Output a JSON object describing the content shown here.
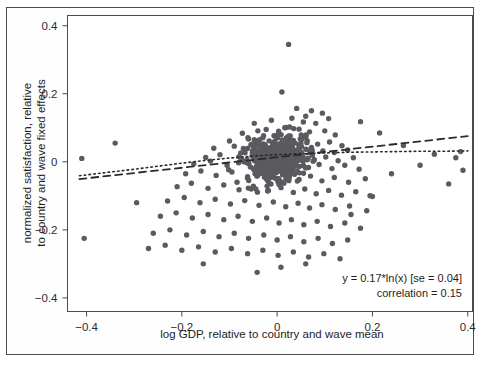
{
  "figure": {
    "background_color": "#ffffff",
    "frame_color": "#4a4a4f",
    "point_color": "#5a5a5f",
    "line_color": "#2b2b2b"
  },
  "axes": {
    "x_label": "log GDP, relative to country and wave mean",
    "y_label_line1": "normalized satisfaction, relative",
    "y_label_line2": "to country and wave fixed effects",
    "x_ticks": [
      "−0.4",
      "−0.2",
      "0",
      "0.2",
      "0.4"
    ],
    "y_ticks": [
      "0.4",
      "0.2",
      "0",
      "−0.2",
      "−0.4"
    ]
  },
  "annotations": {
    "fit_equation": "y = 0.17*ln(x) [se = 0.04]",
    "correlation": "correlation = 0.15"
  },
  "chart_data": {
    "type": "scatter",
    "title": "",
    "xlabel": "log GDP, relative to country and wave mean",
    "ylabel": "normalized satisfaction, relative to country and wave fixed effects",
    "xlim": [
      -0.44,
      0.41
    ],
    "ylim": [
      -0.44,
      0.43
    ],
    "x_ticks": [
      -0.4,
      -0.2,
      0,
      0.2,
      0.4
    ],
    "y_ticks": [
      -0.4,
      -0.2,
      0,
      0.2,
      0.4
    ],
    "grid": false,
    "legend": null,
    "annotations": [
      {
        "text": "y = 0.17*ln(x) [se = 0.04]",
        "x": 0.39,
        "y": -0.3,
        "align": "right"
      },
      {
        "text": "correlation = 0.15",
        "x": 0.39,
        "y": -0.335,
        "align": "right"
      }
    ],
    "fits": [
      {
        "name": "log fit (dotted)",
        "style": "dotted",
        "form": "y = 0.17*ln(x) scaled; concave, flattening to the right",
        "points": [
          [
            -0.415,
            -0.041
          ],
          [
            -0.35,
            -0.03
          ],
          [
            -0.3,
            -0.022
          ],
          [
            -0.25,
            -0.013
          ],
          [
            -0.2,
            -0.004
          ],
          [
            -0.15,
            0.004
          ],
          [
            -0.1,
            0.011
          ],
          [
            -0.05,
            0.017
          ],
          [
            0.0,
            0.021
          ],
          [
            0.05,
            0.024
          ],
          [
            0.1,
            0.026
          ],
          [
            0.15,
            0.028
          ],
          [
            0.2,
            0.029
          ],
          [
            0.25,
            0.03
          ],
          [
            0.3,
            0.031
          ],
          [
            0.35,
            0.031
          ],
          [
            0.4,
            0.032
          ]
        ]
      },
      {
        "name": "linear fit (dashed)",
        "style": "dashed",
        "slope": 0.155,
        "intercept": 0.0135,
        "points": [
          [
            -0.415,
            -0.0508
          ],
          [
            0.4,
            0.0755
          ]
        ]
      }
    ],
    "n_points": 612,
    "correlation": 0.15,
    "points": [
      [
        0.024,
        0.345
      ],
      [
        0.01,
        0.205
      ],
      [
        0.041,
        0.157
      ],
      [
        0.072,
        0.15
      ],
      [
        0.095,
        0.143
      ],
      [
        -0.012,
        0.122
      ],
      [
        0.031,
        0.128
      ],
      [
        0.055,
        0.117
      ],
      [
        -0.048,
        0.113
      ],
      [
        0.06,
        0.134
      ],
      [
        0.081,
        0.113
      ],
      [
        0.108,
        0.127
      ],
      [
        0.016,
        0.1
      ],
      [
        -0.023,
        0.095
      ],
      [
        -0.073,
        0.084
      ],
      [
        0.003,
        0.09
      ],
      [
        0.046,
        0.096
      ],
      [
        0.068,
        0.088
      ],
      [
        0.1,
        0.091
      ],
      [
        0.122,
        0.079
      ],
      [
        -0.1,
        0.061
      ],
      [
        -0.06,
        0.067
      ],
      [
        -0.03,
        0.071
      ],
      [
        -0.005,
        0.06
      ],
      [
        0.02,
        0.069
      ],
      [
        0.038,
        0.055
      ],
      [
        0.063,
        0.062
      ],
      [
        0.085,
        0.052
      ],
      [
        0.11,
        0.058
      ],
      [
        0.136,
        0.047
      ],
      [
        -0.133,
        0.04
      ],
      [
        -0.09,
        0.046
      ],
      [
        -0.055,
        0.05
      ],
      [
        -0.025,
        0.036
      ],
      [
        0.002,
        0.045
      ],
      [
        0.026,
        0.038
      ],
      [
        0.048,
        0.03
      ],
      [
        0.072,
        0.042
      ],
      [
        0.096,
        0.032
      ],
      [
        0.12,
        0.027
      ],
      [
        0.148,
        0.035
      ],
      [
        -0.15,
        0.013
      ],
      [
        -0.12,
        0.021
      ],
      [
        -0.08,
        0.015
      ],
      [
        -0.045,
        0.024
      ],
      [
        -0.018,
        0.01
      ],
      [
        0.006,
        0.018
      ],
      [
        0.03,
        0.008
      ],
      [
        0.054,
        0.016
      ],
      [
        0.078,
        0.006
      ],
      [
        0.102,
        0.014
      ],
      [
        0.128,
        0.003
      ],
      [
        0.16,
        0.012
      ],
      [
        -0.175,
        -0.006
      ],
      [
        -0.14,
        0.002
      ],
      [
        -0.105,
        -0.01
      ],
      [
        -0.07,
        0.0
      ],
      [
        -0.04,
        -0.014
      ],
      [
        -0.01,
        -0.004
      ],
      [
        0.012,
        -0.016
      ],
      [
        0.036,
        -0.006
      ],
      [
        0.06,
        -0.018
      ],
      [
        0.088,
        -0.008
      ],
      [
        0.115,
        -0.02
      ],
      [
        0.142,
        -0.01
      ],
      [
        0.172,
        -0.022
      ],
      [
        -0.192,
        -0.035
      ],
      [
        -0.16,
        -0.027
      ],
      [
        -0.128,
        -0.04
      ],
      [
        -0.095,
        -0.03
      ],
      [
        -0.062,
        -0.044
      ],
      [
        -0.032,
        -0.034
      ],
      [
        -0.004,
        -0.048
      ],
      [
        0.022,
        -0.038
      ],
      [
        0.046,
        -0.052
      ],
      [
        0.07,
        -0.042
      ],
      [
        0.094,
        -0.056
      ],
      [
        0.12,
        -0.046
      ],
      [
        0.15,
        -0.06
      ],
      [
        0.185,
        -0.05
      ],
      [
        -0.21,
        -0.073
      ],
      [
        -0.18,
        -0.063
      ],
      [
        -0.145,
        -0.078
      ],
      [
        -0.112,
        -0.068
      ],
      [
        -0.08,
        -0.082
      ],
      [
        -0.05,
        -0.072
      ],
      [
        -0.02,
        -0.086
      ],
      [
        0.008,
        -0.076
      ],
      [
        0.034,
        -0.09
      ],
      [
        0.058,
        -0.08
      ],
      [
        0.082,
        -0.094
      ],
      [
        0.108,
        -0.084
      ],
      [
        0.135,
        -0.098
      ],
      [
        0.165,
        -0.088
      ],
      [
        0.2,
        -0.102
      ],
      [
        -0.23,
        -0.115
      ],
      [
        -0.195,
        -0.105
      ],
      [
        -0.162,
        -0.12
      ],
      [
        -0.13,
        -0.11
      ],
      [
        -0.098,
        -0.124
      ],
      [
        -0.068,
        -0.114
      ],
      [
        -0.038,
        -0.128
      ],
      [
        -0.008,
        -0.118
      ],
      [
        0.018,
        -0.132
      ],
      [
        0.044,
        -0.122
      ],
      [
        0.068,
        -0.136
      ],
      [
        0.094,
        -0.126
      ],
      [
        0.122,
        -0.14
      ],
      [
        0.152,
        -0.13
      ],
      [
        0.188,
        -0.144
      ],
      [
        -0.245,
        -0.16
      ],
      [
        -0.212,
        -0.15
      ],
      [
        -0.178,
        -0.165
      ],
      [
        -0.145,
        -0.155
      ],
      [
        -0.112,
        -0.17
      ],
      [
        -0.082,
        -0.16
      ],
      [
        -0.052,
        -0.175
      ],
      [
        -0.022,
        -0.165
      ],
      [
        0.004,
        -0.18
      ],
      [
        0.03,
        -0.17
      ],
      [
        0.056,
        -0.185
      ],
      [
        0.084,
        -0.175
      ],
      [
        0.112,
        -0.19
      ],
      [
        0.142,
        -0.18
      ],
      [
        0.175,
        -0.195
      ],
      [
        -0.26,
        -0.21
      ],
      [
        -0.225,
        -0.2
      ],
      [
        -0.19,
        -0.215
      ],
      [
        -0.155,
        -0.205
      ],
      [
        -0.122,
        -0.22
      ],
      [
        -0.09,
        -0.21
      ],
      [
        -0.06,
        -0.225
      ],
      [
        -0.028,
        -0.215
      ],
      [
        0.0,
        -0.23
      ],
      [
        0.028,
        -0.22
      ],
      [
        0.056,
        -0.235
      ],
      [
        0.086,
        -0.225
      ],
      [
        0.116,
        -0.24
      ],
      [
        0.148,
        -0.23
      ],
      [
        -0.27,
        -0.255
      ],
      [
        -0.235,
        -0.245
      ],
      [
        -0.2,
        -0.26
      ],
      [
        -0.165,
        -0.25
      ],
      [
        -0.13,
        -0.265
      ],
      [
        -0.096,
        -0.255
      ],
      [
        -0.062,
        -0.27
      ],
      [
        -0.03,
        -0.26
      ],
      [
        0.002,
        -0.275
      ],
      [
        0.034,
        -0.265
      ],
      [
        0.066,
        -0.28
      ],
      [
        0.098,
        -0.27
      ],
      [
        0.132,
        -0.285
      ],
      [
        -0.41,
        0.01
      ],
      [
        -0.405,
        -0.225
      ],
      [
        -0.34,
        0.055
      ],
      [
        -0.295,
        -0.12
      ],
      [
        0.385,
        0.03
      ],
      [
        0.39,
        -0.025
      ],
      [
        0.375,
        0.012
      ],
      [
        0.36,
        -0.065
      ],
      [
        0.33,
        0.022
      ],
      [
        0.3,
        -0.01
      ],
      [
        0.265,
        0.048
      ],
      [
        0.24,
        -0.035
      ],
      [
        0.215,
        0.085
      ],
      [
        0.195,
        -0.1
      ],
      [
        0.175,
        0.118
      ],
      [
        0.155,
        -0.155
      ],
      [
        0.008,
        -0.31
      ],
      [
        -0.042,
        -0.325
      ],
      [
        0.06,
        -0.3
      ],
      [
        -0.155,
        -0.3
      ]
    ]
  }
}
